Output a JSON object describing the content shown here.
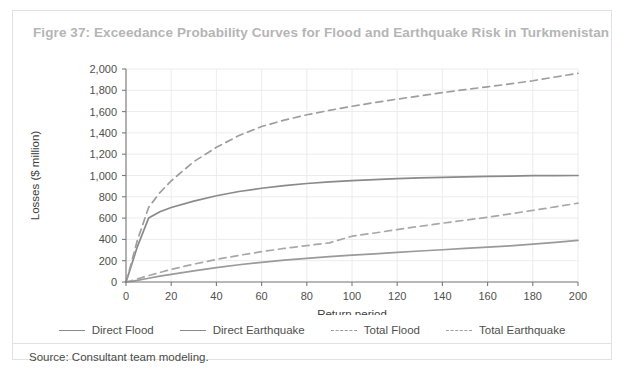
{
  "figure": {
    "title": "Figre 37: Exceedance Probability Curves for Flood and Earthquake Risk in Turkmenistan",
    "source": "Source: Consultant team modeling."
  },
  "legend": {
    "items": [
      {
        "label": "Direct Flood",
        "style": "solid",
        "color": "#8a8a8a"
      },
      {
        "label": "Direct Earthquake",
        "style": "solid",
        "color": "#9a9a9a"
      },
      {
        "label": "Total Flood",
        "style": "dashed",
        "color": "#9e9e9e"
      },
      {
        "label": "Total Earthquake",
        "style": "dashed",
        "color": "#a8a8a8"
      }
    ]
  },
  "chart_data": {
    "type": "line",
    "title": "Figre 37: Exceedance Probability Curves for Flood and Earthquake Risk in Turkmenistan",
    "xlabel": "Return period",
    "ylabel": "Losses ($ million)",
    "xlim": [
      0,
      200
    ],
    "ylim": [
      0,
      2000
    ],
    "xticks": [
      0,
      20,
      40,
      60,
      80,
      100,
      120,
      140,
      160,
      180,
      200
    ],
    "xtick_labels": [
      "0",
      "20",
      "40",
      "60",
      "80",
      "100",
      "120",
      "140",
      "160",
      "180",
      "200"
    ],
    "yticks": [
      0,
      200,
      400,
      600,
      800,
      1000,
      1200,
      1400,
      1600,
      1800,
      2000
    ],
    "ytick_labels": [
      "0",
      "200",
      "400",
      "600",
      "800",
      "1,000",
      "1,200",
      "1,400",
      "1,600",
      "1,800",
      "2,000"
    ],
    "grid": true,
    "legend_position": "bottom",
    "x": [
      0,
      2,
      5,
      10,
      15,
      20,
      30,
      40,
      50,
      60,
      70,
      80,
      90,
      100,
      110,
      120,
      130,
      140,
      150,
      160,
      170,
      180,
      190,
      200
    ],
    "series": [
      {
        "name": "Direct Flood",
        "style": "solid",
        "color": "#8a8a8a",
        "values": [
          0,
          130,
          330,
          600,
          660,
          700,
          760,
          810,
          850,
          880,
          905,
          925,
          940,
          952,
          962,
          970,
          977,
          983,
          988,
          992,
          995,
          998,
          999,
          1000
        ]
      },
      {
        "name": "Direct Earthquake",
        "style": "solid",
        "color": "#9a9a9a",
        "values": [
          0,
          5,
          15,
          35,
          55,
          72,
          105,
          135,
          162,
          185,
          205,
          222,
          238,
          252,
          265,
          278,
          291,
          303,
          315,
          327,
          340,
          355,
          372,
          390
        ]
      },
      {
        "name": "Total Flood",
        "style": "dashed",
        "color": "#9e9e9e",
        "values": [
          0,
          150,
          390,
          700,
          840,
          950,
          1130,
          1265,
          1375,
          1460,
          1520,
          1570,
          1612,
          1650,
          1685,
          1717,
          1748,
          1778,
          1806,
          1833,
          1860,
          1890,
          1925,
          1960
        ]
      },
      {
        "name": "Total Earthquake",
        "style": "dashed",
        "color": "#a8a8a8",
        "values": [
          0,
          10,
          28,
          60,
          90,
          118,
          168,
          212,
          250,
          285,
          315,
          342,
          368,
          430,
          460,
          492,
          523,
          552,
          580,
          608,
          640,
          672,
          706,
          740
        ]
      }
    ]
  }
}
